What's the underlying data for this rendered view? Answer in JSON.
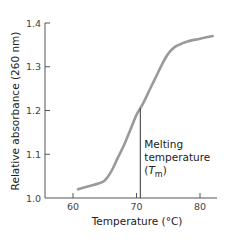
{
  "chart_data": {
    "type": "line",
    "title": "",
    "xlabel": "Temperature (°C)",
    "ylabel": "Relative absorbance (260 nm)",
    "xlim": [
      56,
      84
    ],
    "ylim": [
      1.0,
      1.4
    ],
    "x_ticks": [
      60,
      70,
      80
    ],
    "x_tick_labels": [
      "60",
      "70",
      "80"
    ],
    "y_ticks": [
      1.0,
      1.1,
      1.2,
      1.3,
      1.4
    ],
    "y_tick_labels": [
      "1.0",
      "1.1",
      "1.2",
      "1.3",
      "1.4"
    ],
    "grid": false,
    "legend": null,
    "series": [
      {
        "name": "DNA melting curve",
        "x": [
          60.8,
          62,
          64,
          65,
          66,
          67,
          68,
          69,
          70,
          71,
          72,
          73,
          74,
          75,
          76,
          77,
          78,
          80,
          82
        ],
        "y": [
          1.02,
          1.025,
          1.033,
          1.04,
          1.06,
          1.09,
          1.12,
          1.155,
          1.19,
          1.215,
          1.245,
          1.275,
          1.305,
          1.33,
          1.345,
          1.352,
          1.358,
          1.364,
          1.37
        ]
      }
    ],
    "annotations": [
      {
        "type": "vertical_line",
        "x": 70.6,
        "y_from": 1.0,
        "y_to": 1.205,
        "label_line1": "Melting",
        "label_line2": "temperature",
        "label_line3_symbol": "T",
        "label_line3_subscript": "m"
      }
    ]
  }
}
